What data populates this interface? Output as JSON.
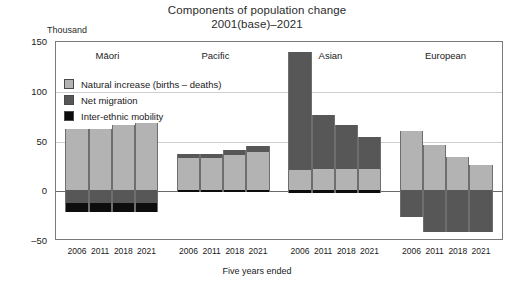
{
  "chart_data": {
    "type": "bar",
    "title": "Components of population change",
    "subtitle": "2001(base)–2021",
    "ylabel": "Thousand",
    "xlabel": "Five years ended",
    "ylim": [
      -50,
      150
    ],
    "yticks": [
      150,
      100,
      50,
      0,
      -50
    ],
    "ytick_labels": [
      "150",
      "100",
      "50",
      "0",
      "–50"
    ],
    "grid": true,
    "legend_position": "upper-left-inside",
    "stacked": true,
    "categories": [
      "2006",
      "2011",
      "2018",
      "2021"
    ],
    "groups": [
      "Māori",
      "Pacific",
      "Asian",
      "European"
    ],
    "series": [
      {
        "name": "Natural increase (births – deaths)",
        "color": "#b3b3b3",
        "values": {
          "Māori": [
            62,
            62,
            66,
            68
          ],
          "Pacific": [
            32,
            32,
            35,
            38
          ],
          "Asian": [
            20,
            21,
            21,
            21
          ],
          "European": [
            60,
            45,
            33,
            25
          ]
        }
      },
      {
        "name": "Net migration",
        "color": "#575757",
        "values": {
          "Māori": [
            -13,
            -13,
            -13,
            -13
          ],
          "Pacific": [
            4,
            4,
            5,
            6
          ],
          "Asian": [
            120,
            55,
            45,
            33
          ],
          "European": [
            -28,
            -43,
            -43,
            -43
          ]
        }
      },
      {
        "name": "Inter-ethnic mobility",
        "color": "#0d0d0d",
        "values": {
          "Māori": [
            -10,
            -10,
            -10,
            -10
          ],
          "Pacific": [
            -2,
            -2,
            -2,
            -2
          ],
          "Asian": [
            -3,
            -3,
            -3,
            -3
          ],
          "European": [
            0,
            0,
            0,
            0
          ]
        }
      }
    ]
  },
  "header": {
    "title": "Components of population change",
    "subtitle": "2001(base)–2021"
  },
  "axes": {
    "y_unit_label": "Thousand",
    "x_title": "Five years ended",
    "y_tick_labels": [
      "150",
      "100",
      "50",
      "0",
      "–50"
    ],
    "x_tick_labels": [
      "2006",
      "2011",
      "2018",
      "2021"
    ]
  },
  "groups": [
    {
      "label": "Māori"
    },
    {
      "label": "Pacific"
    },
    {
      "label": "Asian"
    },
    {
      "label": "European"
    }
  ],
  "legend": {
    "items": [
      {
        "label": "Natural increase (births – deaths)",
        "color": "#b3b3b3"
      },
      {
        "label": "Net migration",
        "color": "#575757"
      },
      {
        "label": "Inter-ethnic mobility",
        "color": "#0d0d0d"
      }
    ]
  }
}
